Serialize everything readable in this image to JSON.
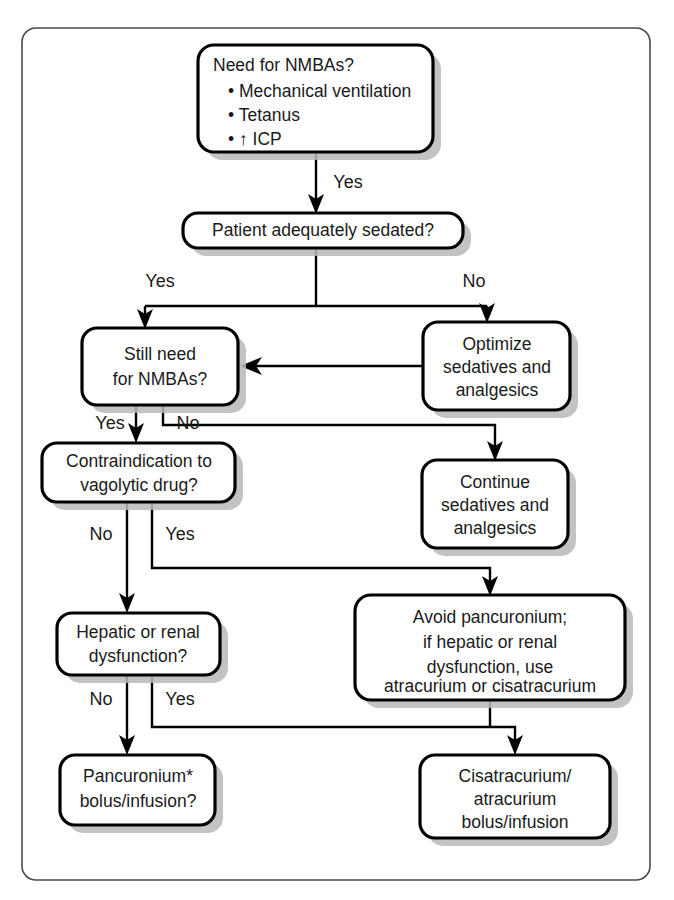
{
  "diagram": {
    "colors": {
      "frame_stroke": "#4a4a4a",
      "box_stroke": "#000000",
      "box_fill": "#ffffff",
      "shadow": "#b9b9b9",
      "text": "#1a1a1a",
      "background": "#ffffff"
    },
    "nodes": {
      "need_nmbas": {
        "heading": "Need for NMBAs?",
        "bullets": [
          "• Mechanical ventilation",
          "• Tetanus",
          "• ↑ ICP"
        ]
      },
      "sedated": {
        "lines": [
          "Patient adequately sedated?"
        ]
      },
      "still_need": {
        "lines": [
          "Still need",
          "for NMBAs?"
        ]
      },
      "optimize": {
        "lines": [
          "Optimize",
          "sedatives and",
          "analgesics"
        ]
      },
      "contraindication": {
        "lines": [
          "Contraindication to",
          "vagolytic drug?"
        ]
      },
      "continue": {
        "lines": [
          "Continue",
          "sedatives and",
          "analgesics"
        ]
      },
      "hepatic": {
        "lines": [
          "Hepatic or renal",
          "dysfunction?"
        ]
      },
      "avoid_pancuronium": {
        "lines": [
          "Avoid pancuronium;",
          "if hepatic or renal",
          "dysfunction,  use",
          "atracurium or cisatracurium"
        ]
      },
      "pancuronium": {
        "lines": [
          "Pancuronium*",
          "bolus/infusion?"
        ]
      },
      "cisatracurium": {
        "lines": [
          "Cisatracurium/",
          "atracurium",
          "bolus/infusion"
        ]
      }
    },
    "edge_labels": {
      "need_to_sedated": "Yes",
      "sedated_yes": "Yes",
      "sedated_no": "No",
      "still_need_yes": "Yes",
      "still_need_no": "No",
      "contraindication_no": "No",
      "contraindication_yes": "Yes",
      "hepatic_no": "No",
      "hepatic_yes": "Yes"
    }
  }
}
